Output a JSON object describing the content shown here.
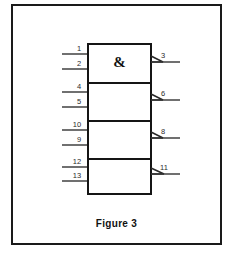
{
  "figure": {
    "caption": "Figure 3",
    "frame": {
      "x": 11,
      "y": 4,
      "width": 211,
      "height": 241,
      "border_color": "#1a1a1a"
    }
  },
  "schematic": {
    "type": "logic-gate-diagram",
    "notation": "IEC rectangular",
    "symbol_text": "&",
    "gate_count": 4,
    "line_color": "#151515",
    "background": "#ffffff",
    "stack": {
      "left": 88,
      "right": 151,
      "top": 44,
      "bottom": 194
    },
    "gates": [
      {
        "index": 0,
        "label": "&",
        "box": {
          "x": 88,
          "y": 44,
          "width": 63,
          "height": 39
        },
        "inputs": [
          {
            "pin": "1",
            "y": 54,
            "label_x": 79,
            "label_y": 51
          },
          {
            "pin": "2",
            "y": 69,
            "label_x": 79,
            "label_y": 66
          }
        ],
        "output": {
          "pin": "3",
          "y": 62,
          "label_x": 163,
          "label_y": 58
        }
      },
      {
        "index": 1,
        "label": "",
        "box": {
          "x": 88,
          "y": 83,
          "width": 63,
          "height": 38
        },
        "inputs": [
          {
            "pin": "4",
            "y": 92,
            "label_x": 79,
            "label_y": 89
          },
          {
            "pin": "5",
            "y": 107,
            "label_x": 79,
            "label_y": 104
          }
        ],
        "output": {
          "pin": "6",
          "y": 100,
          "label_x": 163,
          "label_y": 96
        }
      },
      {
        "index": 2,
        "label": "",
        "box": {
          "x": 88,
          "y": 121,
          "width": 63,
          "height": 38
        },
        "inputs": [
          {
            "pin": "10",
            "y": 130,
            "label_x": 77,
            "label_y": 127
          },
          {
            "pin": "9",
            "y": 145,
            "label_x": 79,
            "label_y": 142
          }
        ],
        "output": {
          "pin": "8",
          "y": 138,
          "label_x": 163,
          "label_y": 134
        }
      },
      {
        "index": 3,
        "label": "",
        "box": {
          "x": 88,
          "y": 159,
          "width": 63,
          "height": 35
        },
        "inputs": [
          {
            "pin": "12",
            "y": 167,
            "label_x": 77,
            "label_y": 164
          },
          {
            "pin": "13",
            "y": 181,
            "label_x": 77,
            "label_y": 178
          }
        ],
        "output": {
          "pin": "11",
          "y": 174,
          "label_x": 164,
          "label_y": 170
        }
      }
    ],
    "input_lead_start_x": 62,
    "output_lead_end_x": 180
  }
}
